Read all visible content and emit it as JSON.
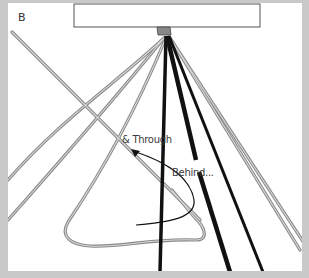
{
  "panel": {
    "letter": "B"
  },
  "annotations": {
    "through": "& Through",
    "behind": "Behind..."
  },
  "colors": {
    "frame": "#c9c9c9",
    "background": "#ffffff",
    "cord_dark": "#111111",
    "cord_light": "#9a9a9a",
    "bar_outline": "#555555"
  }
}
